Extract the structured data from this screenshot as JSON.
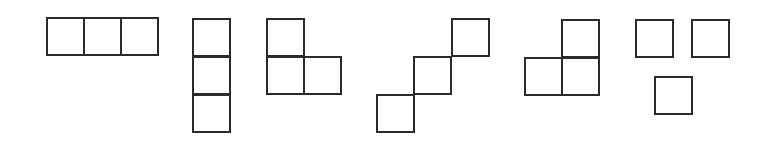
{
  "diagram": {
    "title": "",
    "background": "#ffffff",
    "stroke_color": "#2b2b2b",
    "stroke_width": 2,
    "cell_size": 37,
    "shapes": [
      {
        "name": "horizontal-tromino",
        "cells": [
          {
            "x": 47,
            "y": 18
          },
          {
            "x": 84,
            "y": 18
          },
          {
            "x": 121,
            "y": 18
          }
        ]
      },
      {
        "name": "vertical-tromino",
        "cells": [
          {
            "x": 193,
            "y": 19
          },
          {
            "x": 193,
            "y": 57
          },
          {
            "x": 193,
            "y": 95
          }
        ]
      },
      {
        "name": "l-tromino",
        "cells": [
          {
            "x": 267,
            "y": 19
          },
          {
            "x": 267,
            "y": 57
          },
          {
            "x": 304,
            "y": 57
          }
        ]
      },
      {
        "name": "diagonal-tromino",
        "cells": [
          {
            "x": 452,
            "y": 19
          },
          {
            "x": 414,
            "y": 57
          },
          {
            "x": 377,
            "y": 95
          }
        ]
      },
      {
        "name": "reverse-l-tromino",
        "cells": [
          {
            "x": 562,
            "y": 20
          },
          {
            "x": 525,
            "y": 58
          },
          {
            "x": 562,
            "y": 58
          }
        ]
      },
      {
        "name": "separated-squares",
        "cells": [
          {
            "x": 636,
            "y": 20
          },
          {
            "x": 692,
            "y": 20
          },
          {
            "x": 655,
            "y": 77
          }
        ]
      }
    ]
  }
}
